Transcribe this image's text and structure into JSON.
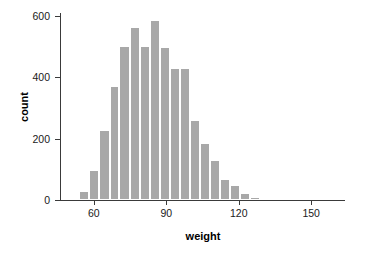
{
  "chart_data": {
    "type": "bar",
    "title": "",
    "subtitle": "",
    "xlabel": "weight",
    "ylabel": "count",
    "xlim": [
      46,
      164
    ],
    "ylim": [
      0,
      625
    ],
    "grid": false,
    "legend": null,
    "bar_color": "#a8a8a8",
    "axis_color": "#3a3a3a",
    "bin_width": 4.15,
    "x_ticks": [
      60,
      90,
      120,
      150
    ],
    "x_tick_labels": [
      "60",
      "90",
      "120",
      "150"
    ],
    "y_ticks": [
      0,
      200,
      400,
      600
    ],
    "y_tick_labels": [
      "0",
      "200",
      "400",
      "600"
    ],
    "bins": [
      {
        "x_left": 54.0,
        "x_right": 58.2,
        "center": 56.1,
        "count": 28
      },
      {
        "x_left": 58.2,
        "x_right": 62.3,
        "center": 60.2,
        "count": 98
      },
      {
        "x_left": 62.3,
        "x_right": 66.5,
        "center": 64.4,
        "count": 228
      },
      {
        "x_left": 66.5,
        "x_right": 70.6,
        "center": 68.6,
        "count": 372
      },
      {
        "x_left": 70.6,
        "x_right": 74.8,
        "center": 72.7,
        "count": 500
      },
      {
        "x_left": 74.8,
        "x_right": 79.0,
        "center": 76.9,
        "count": 562
      },
      {
        "x_left": 79.0,
        "x_right": 83.1,
        "center": 81.0,
        "count": 500
      },
      {
        "x_left": 83.1,
        "x_right": 87.3,
        "center": 85.2,
        "count": 585
      },
      {
        "x_left": 87.3,
        "x_right": 91.4,
        "center": 89.4,
        "count": 498
      },
      {
        "x_left": 91.4,
        "x_right": 95.6,
        "center": 93.5,
        "count": 430
      },
      {
        "x_left": 95.6,
        "x_right": 99.8,
        "center": 97.7,
        "count": 430
      },
      {
        "x_left": 99.8,
        "x_right": 103.9,
        "center": 101.9,
        "count": 260
      },
      {
        "x_left": 103.9,
        "x_right": 108.1,
        "center": 106.0,
        "count": 185
      },
      {
        "x_left": 108.1,
        "x_right": 112.2,
        "center": 110.2,
        "count": 130
      },
      {
        "x_left": 112.2,
        "x_right": 116.4,
        "center": 114.3,
        "count": 68
      },
      {
        "x_left": 116.4,
        "x_right": 120.6,
        "center": 118.5,
        "count": 48
      },
      {
        "x_left": 120.6,
        "x_right": 124.7,
        "center": 122.7,
        "count": 22
      },
      {
        "x_left": 124.7,
        "x_right": 128.9,
        "center": 126.8,
        "count": 9
      },
      {
        "x_left": 128.9,
        "x_right": 133.0,
        "center": 131.0,
        "count": 6
      },
      {
        "x_left": 133.0,
        "x_right": 137.2,
        "center": 135.1,
        "count": 5
      }
    ]
  }
}
